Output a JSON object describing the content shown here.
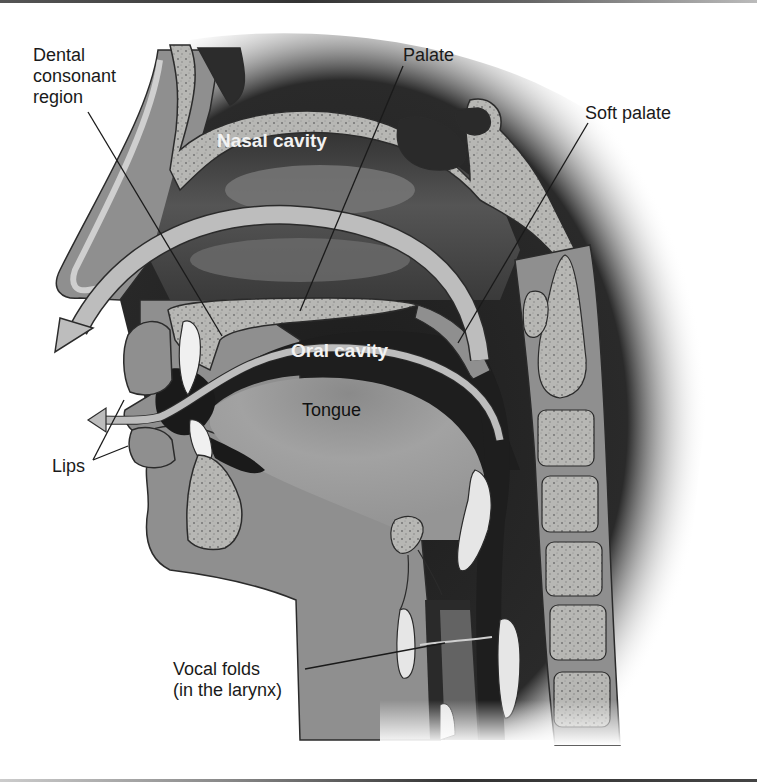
{
  "figure": {
    "colors": {
      "background": "#ffffff",
      "tissue": "#8f8f8f",
      "bone": "#b9b9b6",
      "bone_speckle": "#6f6f6f",
      "cavity_dark": "#1e1e1e",
      "cartilage_light": "#e6e6e6",
      "arrow_fill": "#bdbdbd",
      "outline": "#2b2b2b",
      "leader_line": "#1a1a1a"
    }
  },
  "labels": {
    "dental_consonant_region": "Dental\nconsonant\nregion",
    "palate": "Palate",
    "soft_palate": "Soft palate",
    "nasal_cavity": "Nasal cavity",
    "oral_cavity": "Oral cavity",
    "tongue": "Tongue",
    "lips": "Lips",
    "vocal_folds": "Vocal folds\n(in the larynx)"
  },
  "annotations": [
    {
      "label": "Dental consonant region",
      "points_to": "alveolar ridge behind upper teeth"
    },
    {
      "label": "Palate",
      "points_to": "hard palate"
    },
    {
      "label": "Soft palate",
      "points_to": "velum"
    },
    {
      "label": "Lips",
      "points_to": "upper and lower lips"
    },
    {
      "label": "Vocal folds (in the larynx)",
      "points_to": "larynx"
    }
  ],
  "airflow_arrows": [
    {
      "name": "nasal-airflow",
      "exits": "nose"
    },
    {
      "name": "oral-airflow",
      "exits": "mouth"
    }
  ]
}
